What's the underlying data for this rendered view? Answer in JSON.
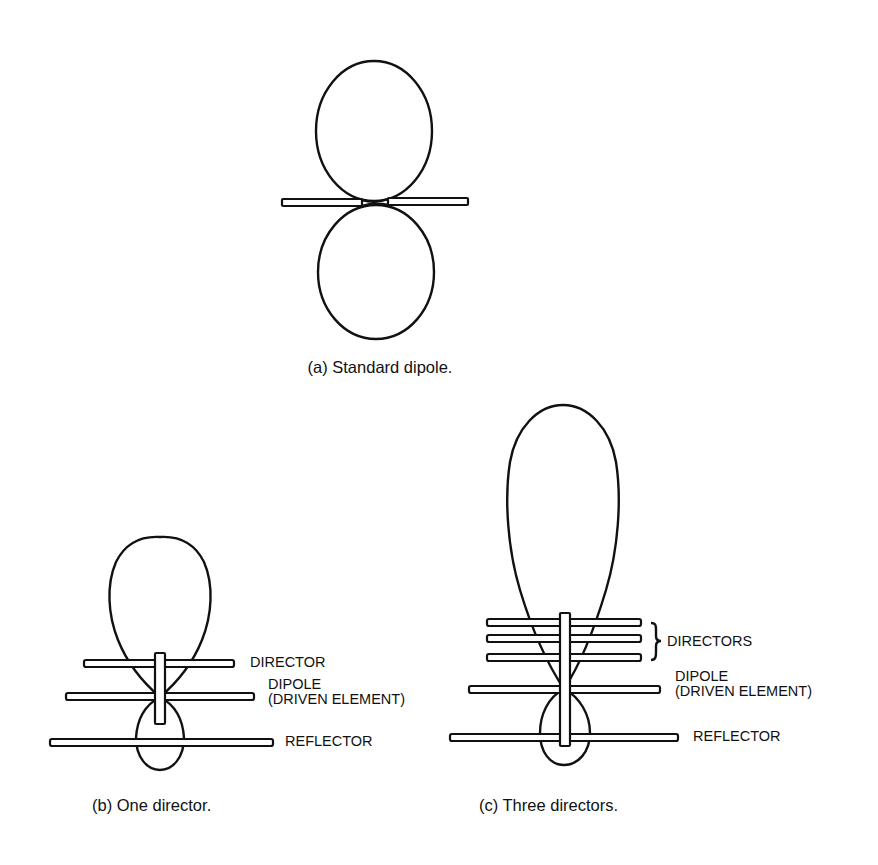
{
  "figure": {
    "panels": [
      {
        "id": "a",
        "caption": "(a) Standard dipole.",
        "elements": [
          "dipole"
        ],
        "pattern": "figure-eight (two equal lobes)"
      },
      {
        "id": "b",
        "caption": "(b) One director.",
        "labels": {
          "director": "DIRECTOR",
          "dipole_line1": "DIPOLE",
          "dipole_line2": "(DRIVEN ELEMENT)",
          "reflector": "REFLECTOR"
        },
        "director_count": 1
      },
      {
        "id": "c",
        "caption": "(c) Three directors.",
        "labels": {
          "directors": "DIRECTORS",
          "dipole_line1": "DIPOLE",
          "dipole_line2": "(DRIVEN ELEMENT)",
          "reflector": "REFLECTOR"
        },
        "director_count": 3
      }
    ],
    "colors": {
      "ink": "#111111",
      "background": "#ffffff"
    }
  }
}
